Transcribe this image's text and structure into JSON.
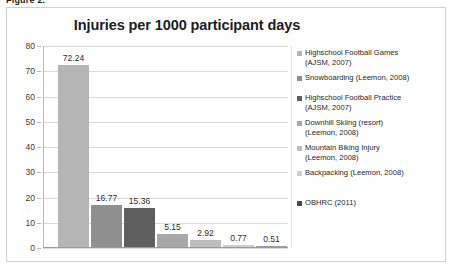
{
  "figure": {
    "caption": "Figure 2."
  },
  "chart_data": {
    "type": "bar",
    "title": "Injuries per 1000 participant days",
    "xlabel": "",
    "ylabel": "",
    "ylim": [
      0,
      80
    ],
    "ytick_step": 10,
    "yticks": [
      "0",
      "10",
      "20",
      "30",
      "40",
      "50",
      "60",
      "70",
      "80"
    ],
    "grid": true,
    "legend_position": "right",
    "categories": [
      "Highschool Football Games (AJSM, 2007)",
      "Snowboarding (Leemon, 2008)",
      "Highschool Football Practice (AJSM, 2007)",
      "Downhill Skiing (resort) (Leemon, 2008)",
      "Mountain Biking Injury (Leemon, 2008)",
      "Backpacking (Leemon, 2008)",
      "OBHRC (2011)"
    ],
    "values": [
      72.24,
      16.77,
      15.36,
      5.15,
      2.92,
      0.77,
      0.51
    ],
    "value_labels": [
      "72.24",
      "16.77",
      "15.36",
      "5.15",
      "2.92",
      "0.77",
      "0.51"
    ],
    "colors": [
      "#b5b5b5",
      "#8f8f8f",
      "#5f5f5f",
      "#a8a8a8",
      "#bdbdbd",
      "#cfcfcf",
      "#9c9c9c"
    ],
    "legend": [
      {
        "label": "Highschool Football Games\n(AJSM, 2007)",
        "color": "#b5b5b5"
      },
      {
        "label": "Snowboarding (Leemon, 2008)",
        "color": "#8f8f8f"
      },
      {
        "label": "Highschool Football Practice\n(AJSM, 2007)",
        "color": "#5f5f5f"
      },
      {
        "label": "Downhill Skiing (resort)\n(Leemon, 2008)",
        "color": "#a8a8a8"
      },
      {
        "label": "Mountain Biking Injury\n(Leemon, 2008)",
        "color": "#bdbdbd"
      },
      {
        "label": "Backpacking (Leemon, 2008)",
        "color": "#cfcfcf"
      },
      {
        "label": "OBHRC (2011)",
        "color": "#4a4a4a"
      }
    ]
  }
}
